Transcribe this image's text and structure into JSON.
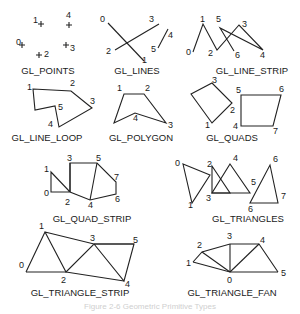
{
  "figure": {
    "panels": [
      {
        "id": "points",
        "title": "GL_POINTS",
        "vertices": [
          {
            "n": "0",
            "x": 22,
            "y": 45,
            "lx": 16,
            "ly": 45
          },
          {
            "n": "1",
            "x": 41,
            "y": 24,
            "lx": 33,
            "ly": 23
          },
          {
            "n": "2",
            "x": 39,
            "y": 55,
            "lx": 44,
            "ly": 57
          },
          {
            "n": "3",
            "x": 66,
            "y": 45,
            "lx": 70,
            "ly": 51
          },
          {
            "n": "4",
            "x": 69,
            "y": 25,
            "lx": 66,
            "ly": 18
          }
        ],
        "title_pos": {
          "x": 48,
          "y": 74
        }
      },
      {
        "id": "lines",
        "title": "GL_LINES",
        "segments": [
          [
            108,
            23,
            144,
            61
          ],
          [
            115,
            50,
            159,
            24
          ],
          [
            158,
            48,
            168,
            29
          ]
        ],
        "labels": [
          {
            "n": "0",
            "x": 100,
            "y": 22
          },
          {
            "n": "1",
            "x": 142,
            "y": 63
          },
          {
            "n": "2",
            "x": 106,
            "y": 54
          },
          {
            "n": "3",
            "x": 149,
            "y": 22
          },
          {
            "n": "4",
            "x": 168,
            "y": 38
          },
          {
            "n": "5",
            "x": 151,
            "y": 52
          }
        ],
        "title_pos": {
          "x": 137,
          "y": 74
        }
      },
      {
        "id": "line_strip",
        "title": "GL_LINE_STRIP",
        "polyline": [
          [
            193,
            52
          ],
          [
            203,
            24
          ],
          [
            217,
            50
          ],
          [
            239,
            25
          ],
          [
            263,
            50
          ],
          [
            220,
            28
          ],
          [
            234,
            51
          ]
        ],
        "labels": [
          {
            "n": "0",
            "x": 186,
            "y": 55
          },
          {
            "n": "1",
            "x": 200,
            "y": 22
          },
          {
            "n": "2",
            "x": 208,
            "y": 56
          },
          {
            "n": "3",
            "x": 242,
            "y": 27
          },
          {
            "n": "4",
            "x": 260,
            "y": 58
          },
          {
            "n": "5",
            "x": 216,
            "y": 22
          },
          {
            "n": "6",
            "x": 235,
            "y": 58
          }
        ],
        "title_pos": {
          "x": 252,
          "y": 74
        }
      },
      {
        "id": "line_loop",
        "title": "GL_LINE_LOOP",
        "polygon": [
          [
            33,
            89
          ],
          [
            71,
            91
          ],
          [
            92,
            108
          ],
          [
            59,
            127
          ],
          [
            55,
            106
          ],
          [
            35,
            110
          ]
        ],
        "labels": [
          {
            "n": "1",
            "x": 27,
            "y": 90
          },
          {
            "n": "2",
            "x": 70,
            "y": 86
          },
          {
            "n": "3",
            "x": 90,
            "y": 104
          },
          {
            "n": "4",
            "x": 48,
            "y": 127
          },
          {
            "n": "5",
            "x": 58,
            "y": 110
          }
        ],
        "title_pos": {
          "x": 47,
          "y": 141
        }
      },
      {
        "id": "polygon",
        "title": "GL_POLYGON",
        "polygon": [
          [
            124,
            94
          ],
          [
            144,
            94
          ],
          [
            166,
            123
          ],
          [
            135,
            113
          ],
          [
            114,
            123
          ]
        ],
        "labels": [
          {
            "n": "1",
            "x": 117,
            "y": 91
          },
          {
            "n": "2",
            "x": 145,
            "y": 91
          },
          {
            "n": "3",
            "x": 168,
            "y": 128
          },
          {
            "n": "4",
            "x": 133,
            "y": 121
          }
        ],
        "title_pos": {
          "x": 141,
          "y": 141
        }
      },
      {
        "id": "quads",
        "title": "GL_QUADS",
        "polygons": [
          [
            [
              191,
              94
            ],
            [
              212,
              83
            ],
            [
              232,
              103
            ],
            [
              212,
              123
            ]
          ],
          [
            [
              241,
              95
            ],
            [
              281,
              95
            ],
            [
              273,
              126
            ],
            [
              241,
              126
            ]
          ]
        ],
        "labels": [
          {
            "n": "1",
            "x": 205,
            "y": 128
          },
          {
            "n": "2",
            "x": 230,
            "y": 113
          },
          {
            "n": "3",
            "x": 212,
            "y": 83
          },
          {
            "n": "4",
            "x": 233,
            "y": 129
          },
          {
            "n": "5",
            "x": 236,
            "y": 93
          },
          {
            "n": "6",
            "x": 279,
            "y": 92
          },
          {
            "n": "7",
            "x": 273,
            "y": 134
          }
        ],
        "title_pos": {
          "x": 232,
          "y": 141
        }
      },
      {
        "id": "quad_strip",
        "title": "GL_QUAD_STRIP",
        "polygon": [
          [
            51,
            172
          ],
          [
            51,
            192
          ],
          [
            70,
            192
          ],
          [
            70,
            163
          ],
          [
            97,
            163
          ],
          [
            116,
            182
          ],
          [
            116,
            194
          ],
          [
            90,
            200
          ],
          [
            70,
            192
          ]
        ],
        "extra": [
          [
            70,
            163
          ],
          [
            70,
            192
          ],
          [
            97,
            163
          ],
          [
            90,
            200
          ]
        ],
        "labels": [
          {
            "n": "0",
            "x": 44,
            "y": 196
          },
          {
            "n": "1",
            "x": 44,
            "y": 172
          },
          {
            "n": "2",
            "x": 65,
            "y": 205
          },
          {
            "n": "3",
            "x": 67,
            "y": 161
          },
          {
            "n": "4",
            "x": 88,
            "y": 208
          },
          {
            "n": "5",
            "x": 96,
            "y": 161
          },
          {
            "n": "6",
            "x": 115,
            "y": 202
          },
          {
            "n": "7",
            "x": 114,
            "y": 180
          }
        ],
        "title_pos": {
          "x": 92,
          "y": 222
        }
      },
      {
        "id": "triangles",
        "title": "GL_TRIANGLES",
        "polygons": [
          [
            [
              183,
              164
            ],
            [
              210,
              175
            ],
            [
              192,
              203
            ]
          ],
          [
            [
              212,
              166
            ],
            [
              230,
              193
            ],
            [
              212,
              193
            ]
          ],
          [
            [
              270,
              165
            ],
            [
              278,
              203
            ],
            [
              250,
              203
            ]
          ]
        ],
        "t2": [
          [
            230,
            164
          ],
          [
            250,
            193
          ],
          [
            212,
            193
          ]
        ],
        "labels": [
          {
            "n": "0",
            "x": 175,
            "y": 166
          },
          {
            "n": "1",
            "x": 188,
            "y": 208
          },
          {
            "n": "2",
            "x": 207,
            "y": 167
          },
          {
            "n": "3",
            "x": 206,
            "y": 201
          },
          {
            "n": "4",
            "x": 233,
            "y": 161
          },
          {
            "n": "5",
            "x": 251,
            "y": 185
          },
          {
            "n": "6",
            "x": 273,
            "y": 162
          },
          {
            "n": "6",
            "x": 248,
            "y": 212
          },
          {
            "n": "7",
            "x": 281,
            "y": 199
          }
        ],
        "title_pos": {
          "x": 248,
          "y": 222
        }
      },
      {
        "id": "triangle_strip",
        "title": "GL_TRIANGLE_STRIP",
        "polyline": [
          [
            26,
            272
          ],
          [
            45,
            232
          ],
          [
            66,
            272
          ],
          [
            94,
            244
          ],
          [
            124,
            281
          ],
          [
            134,
            244
          ],
          [
            94,
            244
          ],
          [
            45,
            232
          ]
        ],
        "extra": [
          [
            26,
            272
          ],
          [
            66,
            272
          ],
          [
            66,
            272
          ],
          [
            124,
            281
          ],
          [
            94,
            244
          ],
          [
            134,
            244
          ]
        ],
        "labels": [
          {
            "n": "0",
            "x": 19,
            "y": 268
          },
          {
            "n": "1",
            "x": 39,
            "y": 229
          },
          {
            "n": "2",
            "x": 61,
            "y": 283
          },
          {
            "n": "3",
            "x": 90,
            "y": 241
          },
          {
            "n": "4",
            "x": 125,
            "y": 287
          },
          {
            "n": "5",
            "x": 133,
            "y": 243
          }
        ],
        "title_pos": {
          "x": 80,
          "y": 296
        }
      },
      {
        "id": "triangle_fan",
        "title": "GL_TRIANGLE_FAN",
        "center": [
          230,
          272
        ],
        "fan": [
          [
            193,
            262
          ],
          [
            202,
            252
          ],
          [
            230,
            244
          ],
          [
            259,
            244
          ],
          [
            278,
            272
          ]
        ],
        "labels": [
          {
            "n": "0",
            "x": 227,
            "y": 283
          },
          {
            "n": "1",
            "x": 186,
            "y": 266
          },
          {
            "n": "2",
            "x": 197,
            "y": 248
          },
          {
            "n": "3",
            "x": 227,
            "y": 239
          },
          {
            "n": "4",
            "x": 260,
            "y": 243
          },
          {
            "n": "5",
            "x": 281,
            "y": 276
          }
        ],
        "title_pos": {
          "x": 232,
          "y": 296
        }
      }
    ],
    "caption": "Figure 2-6  Geometric Primitive Types"
  }
}
